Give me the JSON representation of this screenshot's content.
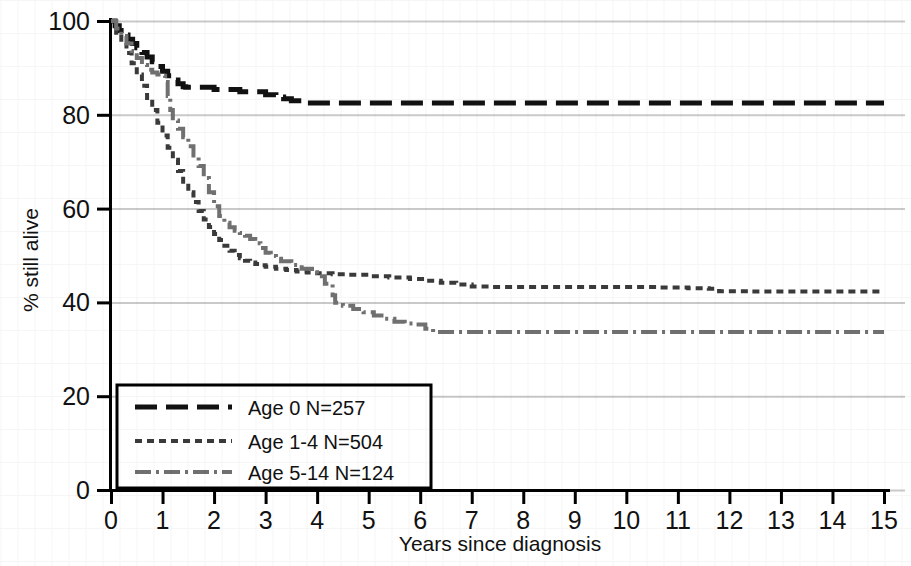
{
  "chart_data": {
    "type": "line",
    "title": "",
    "subtitle": "",
    "xlabel": "Years since diagnosis",
    "ylabel": "% still alive",
    "xlim": [
      0,
      15
    ],
    "ylim": [
      0,
      100
    ],
    "xticks": [
      "0",
      "1",
      "2",
      "3",
      "4",
      "5",
      "6",
      "7",
      "8",
      "9",
      "10",
      "11",
      "12",
      "13",
      "14",
      "15"
    ],
    "yticks": [
      "0",
      "20",
      "40",
      "60",
      "80",
      "100"
    ],
    "grid": "horizontal",
    "legend_position": "lower-left",
    "colors": {
      "age_0": "#111111",
      "age_1_4": "#3a3a3a",
      "age_5_14": "#707070",
      "gridline": "#c9c9c9",
      "axis": "#000000",
      "background": "#ffffff"
    },
    "series": [
      {
        "name": "Age 0 N=257",
        "label": "Age 0 N=257",
        "group": "Age 0",
        "n": 257,
        "dash": "long-dash",
        "color": "#111111",
        "final_value": 82.5,
        "x": [
          0,
          0.08,
          0.16,
          0.25,
          0.33,
          0.42,
          0.5,
          0.6,
          0.7,
          0.8,
          0.9,
          1.0,
          1.1,
          1.2,
          1.3,
          1.4,
          1.45,
          1.9,
          2.0,
          2.4,
          2.5,
          2.9,
          3.0,
          3.2,
          3.35,
          3.5,
          3.7,
          3.8,
          4.0,
          6.0,
          9.0,
          12.0,
          15.0
        ],
        "y": [
          100,
          99.0,
          98.0,
          97.0,
          96.1,
          95.2,
          94.3,
          93.3,
          92.3,
          91.3,
          90.3,
          89.3,
          88.3,
          87.4,
          86.6,
          86.0,
          85.9,
          85.9,
          85.4,
          85.4,
          84.9,
          84.9,
          84.3,
          83.8,
          83.4,
          83.0,
          82.6,
          82.5,
          82.5,
          82.5,
          82.5,
          82.5,
          82.5
        ]
      },
      {
        "name": "Age 1-4 N=504",
        "label": "Age 1-4 N=504",
        "group": "Age 1-4",
        "n": 504,
        "dash": "short-dash",
        "color": "#3a3a3a",
        "final_value": 42.3,
        "x": [
          0,
          0.1,
          0.2,
          0.3,
          0.4,
          0.5,
          0.6,
          0.7,
          0.8,
          0.9,
          1.0,
          1.1,
          1.2,
          1.3,
          1.4,
          1.5,
          1.6,
          1.7,
          1.8,
          1.9,
          2.0,
          2.1,
          2.2,
          2.3,
          2.4,
          2.5,
          2.6,
          2.7,
          2.8,
          2.9,
          3.0,
          3.2,
          3.4,
          3.6,
          3.8,
          4.0,
          4.3,
          4.6,
          5.0,
          5.4,
          5.8,
          6.1,
          6.4,
          6.7,
          7.0,
          7.4,
          8.0,
          9.0,
          10.0,
          10.6,
          11.2,
          11.6,
          11.8,
          12.4,
          13.2,
          14.0,
          15.0
        ],
        "y": [
          100,
          97.5,
          95.3,
          93.2,
          91.0,
          88.6,
          86.2,
          83.6,
          81.0,
          78.3,
          75.6,
          73.0,
          70.4,
          68.0,
          65.7,
          63.5,
          61.4,
          59.5,
          57.7,
          56.1,
          54.6,
          53.3,
          52.1,
          51.0,
          50.1,
          49.4,
          48.9,
          48.5,
          48.2,
          47.9,
          47.6,
          47.2,
          46.9,
          46.6,
          46.4,
          46.2,
          46.0,
          45.9,
          45.6,
          45.3,
          45.0,
          44.6,
          44.2,
          43.8,
          43.4,
          43.3,
          43.3,
          43.3,
          43.3,
          43.2,
          43.0,
          42.9,
          42.4,
          42.3,
          42.3,
          42.3,
          42.3
        ]
      },
      {
        "name": "Age 5-14 N=124",
        "label": "Age 5-14 N=124",
        "group": "Age 5-14",
        "n": 124,
        "dash": "dash-dot",
        "color": "#707070",
        "final_value": 33.7,
        "x": [
          0,
          0.1,
          0.2,
          0.3,
          0.4,
          0.5,
          0.6,
          0.7,
          0.8,
          0.9,
          1.0,
          1.05,
          1.1,
          1.15,
          1.2,
          1.3,
          1.4,
          1.5,
          1.6,
          1.7,
          1.8,
          1.9,
          2.0,
          2.1,
          2.2,
          2.3,
          2.4,
          2.5,
          2.6,
          2.7,
          2.8,
          2.9,
          3.0,
          3.1,
          3.2,
          3.3,
          3.5,
          3.7,
          3.9,
          4.0,
          4.15,
          4.3,
          4.35,
          4.5,
          4.7,
          4.9,
          5.1,
          5.3,
          5.5,
          5.7,
          5.9,
          6.1,
          6.25,
          6.4,
          8.0,
          10.0,
          12.0,
          15.0
        ],
        "y": [
          100,
          98.4,
          96.8,
          95.2,
          93.6,
          92.1,
          90.6,
          89.6,
          89.0,
          88.6,
          88.3,
          87.0,
          84.0,
          81.0,
          78.8,
          77.0,
          75.2,
          73.3,
          71.3,
          69.1,
          66.5,
          63.5,
          60.5,
          58.4,
          57.0,
          56.0,
          55.3,
          54.8,
          54.2,
          53.5,
          52.6,
          51.6,
          50.6,
          49.9,
          49.3,
          48.8,
          48.0,
          47.2,
          46.3,
          45.6,
          44.0,
          41.5,
          39.9,
          39.3,
          38.6,
          37.9,
          37.2,
          36.5,
          35.9,
          35.5,
          35.3,
          34.4,
          33.7,
          33.7,
          33.7,
          33.7,
          33.7,
          33.7
        ]
      }
    ],
    "annotations": []
  },
  "axes": {
    "y_label": "% still alive",
    "x_label": "Years since diagnosis",
    "y_ticks": [
      "100",
      "80",
      "60",
      "40",
      "20",
      "0"
    ],
    "x_ticks": [
      "0",
      "1",
      "2",
      "3",
      "4",
      "5",
      "6",
      "7",
      "8",
      "9",
      "10",
      "11",
      "12",
      "13",
      "14",
      "15"
    ]
  },
  "legend": {
    "items": [
      {
        "label": "Age 0 N=257",
        "style": "long-dash",
        "color": "#111111"
      },
      {
        "label": "Age 1-4 N=504",
        "style": "short-dash",
        "color": "#3a3a3a"
      },
      {
        "label": "Age 5-14 N=124",
        "style": "dash-dot",
        "color": "#707070"
      }
    ]
  }
}
